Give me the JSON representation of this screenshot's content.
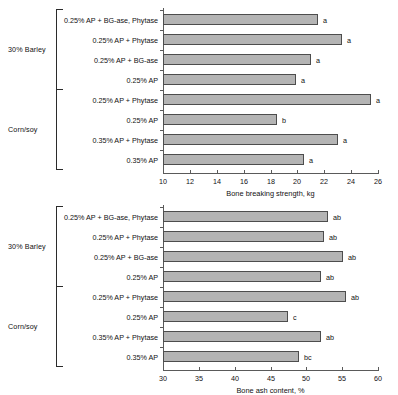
{
  "chart_data": [
    {
      "type": "bar",
      "orientation": "horizontal",
      "title": "",
      "xlabel": "Bone breaking strength, kg",
      "ylabel": "",
      "xlim": [
        10,
        26
      ],
      "xticks": [
        10,
        12,
        14,
        16,
        18,
        20,
        22,
        24,
        26
      ],
      "grid": false,
      "legend": "none",
      "groups": [
        {
          "name": "30% Barley",
          "categories": [
            "0.25% AP + BG-ase, Phytase",
            "0.25% AP + Phytase",
            "0.25% AP + BG-ase",
            "0.25% AP"
          ],
          "values": [
            21.5,
            23.3,
            21.0,
            19.9
          ],
          "annotations": [
            "a",
            "a",
            "a",
            "a"
          ]
        },
        {
          "name": "Corn/soy",
          "categories": [
            "0.25% AP + Phytase",
            "0.25% AP",
            "0.35% AP + Phytase",
            "0.35% AP"
          ],
          "values": [
            25.5,
            18.5,
            23.0,
            20.5
          ],
          "annotations": [
            "a",
            "b",
            "a",
            "a"
          ]
        }
      ]
    },
    {
      "type": "bar",
      "orientation": "horizontal",
      "title": "",
      "xlabel": "Bone ash content, %",
      "ylabel": "",
      "xlim": [
        30,
        60
      ],
      "xticks": [
        30,
        35,
        40,
        45,
        50,
        55,
        60
      ],
      "grid": false,
      "legend": "none",
      "groups": [
        {
          "name": "30% Barley",
          "categories": [
            "0.25% AP + BG-ase, Phytase",
            "0.25% AP + Phytase",
            "0.25% AP + BG-ase",
            "0.25% AP"
          ],
          "values": [
            53.0,
            52.4,
            55.1,
            52.0
          ],
          "annotations": [
            "ab",
            "ab",
            "ab",
            "ab"
          ]
        },
        {
          "name": "Corn/soy",
          "categories": [
            "0.25% AP + Phytase",
            "0.25% AP",
            "0.35% AP + Phytase",
            "0.35% AP"
          ],
          "values": [
            55.5,
            47.4,
            52.0,
            49.0
          ],
          "annotations": [
            "ab",
            "c",
            "ab",
            "bc"
          ]
        }
      ]
    }
  ],
  "style": {
    "bar_fill": "#b4b4b4",
    "bar_stroke": "#4d4d4d",
    "axis_color": "#5a5a5a",
    "text_color": "#111111"
  }
}
